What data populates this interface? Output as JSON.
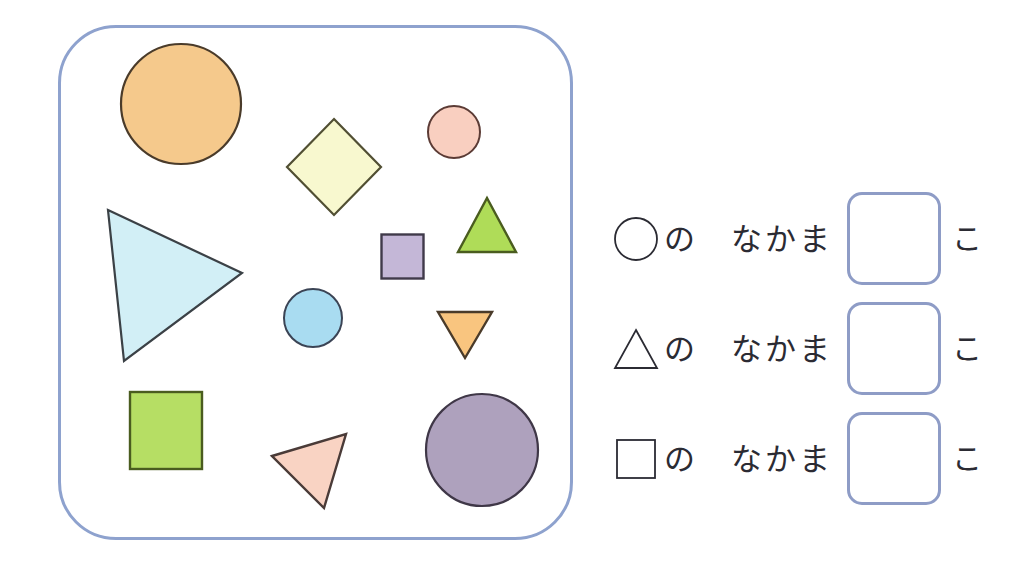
{
  "worksheet": {
    "title": "Shape sorting worksheet",
    "panel_border_color": "#8ea2ce",
    "answer_box_border_color": "#8e9cc6"
  },
  "shapes": [
    {
      "id": "large-orange-circle",
      "kind": "circle",
      "label": "large orange circle",
      "fill": "#F5C98C",
      "stroke": "#4a3b2a",
      "cx": 182,
      "cy": 132,
      "r": 60
    },
    {
      "id": "pale-yellow-diamond",
      "kind": "diamond",
      "label": "pale yellow diamond",
      "fill": "#F8F8CF",
      "stroke": "#514f33",
      "cx": 334,
      "cy": 162,
      "half_w": 47,
      "half_h": 48
    },
    {
      "id": "small-pink-circle",
      "kind": "circle",
      "label": "small pink circle",
      "fill": "#F9CFC0",
      "stroke": "#5b3b35",
      "cx": 452,
      "cy": 130,
      "r": 26
    },
    {
      "id": "green-triangle-up",
      "kind": "triangle-up",
      "label": "green triangle pointing up",
      "fill": "#AFDC58",
      "stroke": "#4a5c1f",
      "apex_x": 485,
      "apex_y": 196,
      "left_x": 455,
      "right_x": 515,
      "base_y": 251
    },
    {
      "id": "purple-small-square",
      "kind": "square",
      "label": "small purple square",
      "fill": "#C4B7D7",
      "stroke": "#403a4a",
      "x": 379,
      "y": 233,
      "w": 41,
      "h": 43
    },
    {
      "id": "cyan-large-triangle",
      "kind": "triangle-free",
      "label": "large pale cyan triangle pointing right",
      "fill": "#D2EFF6",
      "stroke": "#3b4146",
      "points": "105,209 239,272 121,360"
    },
    {
      "id": "blue-circle",
      "kind": "circle",
      "label": "light blue circle",
      "fill": "#A9DCF1",
      "stroke": "#3b4455",
      "cx": 312,
      "cy": 316,
      "r": 29
    },
    {
      "id": "orange-triangle-down",
      "kind": "triangle-down",
      "label": "orange triangle pointing down",
      "fill": "#F9C57F",
      "stroke": "#4a3b2a",
      "left_x": 435,
      "right_x": 490,
      "top_y": 310,
      "apex_x": 463,
      "apex_y": 357
    },
    {
      "id": "green-square",
      "kind": "square",
      "label": "green square",
      "fill": "#B6DE64",
      "stroke": "#4a5c1f",
      "x": 128,
      "y": 390,
      "w": 72,
      "h": 77
    },
    {
      "id": "pink-triangle",
      "kind": "triangle-free",
      "label": "pink tilted triangle",
      "fill": "#F9D3C3",
      "stroke": "#4a3b38",
      "points": "270,453 344,431 322,505"
    },
    {
      "id": "large-purple-circle",
      "kind": "circle",
      "label": "large purple circle",
      "fill": "#AEA1BD",
      "stroke": "#3f3747",
      "cx": 481,
      "cy": 448,
      "r": 56
    }
  ],
  "answers": {
    "rows": [
      {
        "shape_glyph": "circle",
        "shape_glyph_name": "circle-outline-icon",
        "particle": "の",
        "phrase": "なかま",
        "value": "",
        "counter": "こ"
      },
      {
        "shape_glyph": "triangle",
        "shape_glyph_name": "triangle-outline-icon",
        "particle": "の",
        "phrase": "なかま",
        "value": "",
        "counter": "こ"
      },
      {
        "shape_glyph": "square",
        "shape_glyph_name": "square-outline-icon",
        "particle": "の",
        "phrase": "なかま",
        "value": "",
        "counter": "こ"
      }
    ]
  }
}
